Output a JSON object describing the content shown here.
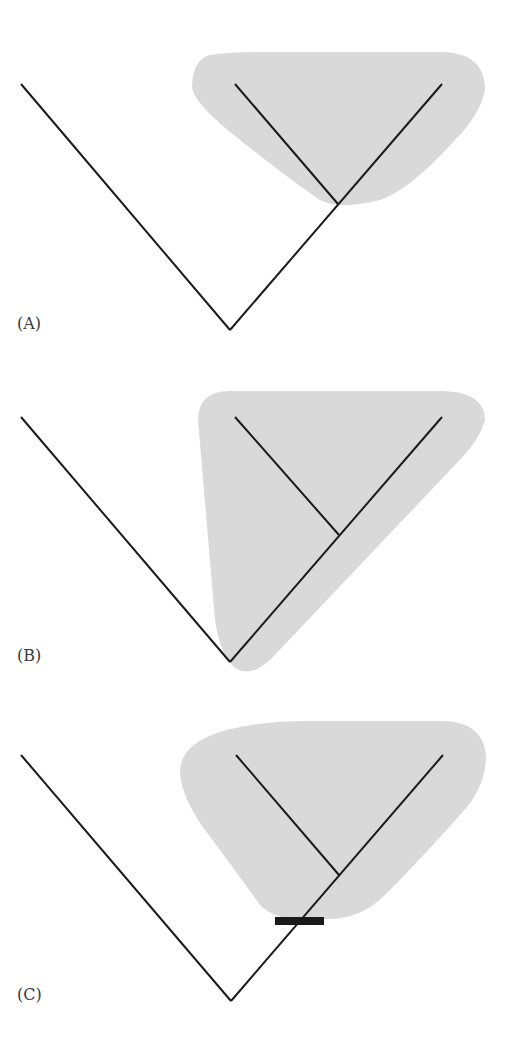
{
  "colors": {
    "line": "#1a1a1a",
    "shade": "#d9d9d9",
    "bar": "#1a1a1a"
  },
  "panels": [
    {
      "label": "(A)",
      "description": "Clade shading excludes stem lineage; includes crown node and descendants"
    },
    {
      "label": "(B)",
      "description": "Clade shading extends to root node including stem lineage"
    },
    {
      "label": "(C)",
      "description": "Clade shading bounded by apomorphy bar on stem branch"
    }
  ]
}
